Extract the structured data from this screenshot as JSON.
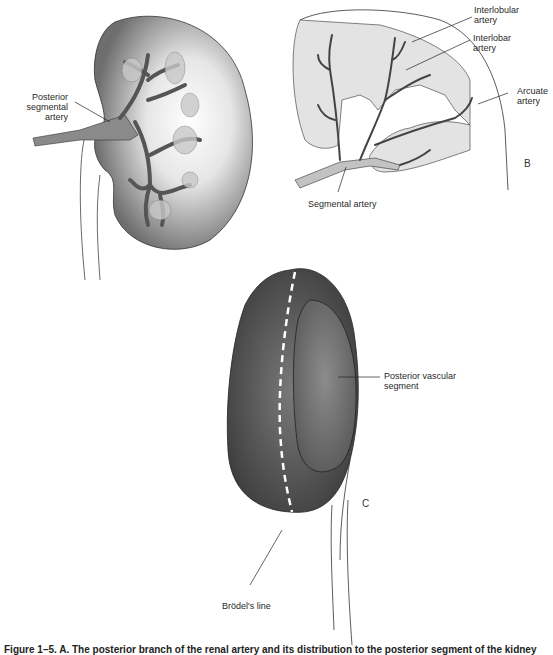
{
  "panels": {
    "a": {
      "labels": {
        "posterior_segmental_artery": "Posterior\nsegmental artery"
      }
    },
    "b": {
      "letter": "B",
      "labels": {
        "interlobular_artery": "Interlobular\nartery",
        "interlobar_artery": "Interlobar\nartery",
        "arcuate_artery": "Arcuate\nartery",
        "segmental_artery": "Segmental artery"
      }
    },
    "c": {
      "letter": "C",
      "labels": {
        "posterior_vascular_segment": "Posterior vascular\nsegment",
        "brodels_line": "Brödel's line"
      }
    }
  },
  "caption": "Figure 1–5. A. The posterior branch of the renal artery and its distribution to the posterior segment of the kidney"
}
